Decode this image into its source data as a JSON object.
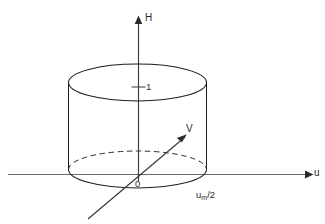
{
  "figure": {
    "background_color": "#ffffff",
    "line_color": "#1d1d1d",
    "axis_color": "#3a3a3a",
    "axes": {
      "vertical": {
        "name": "H-axis",
        "label": "H",
        "arrow": "up"
      },
      "horizontal": {
        "name": "u-axis",
        "label": "u",
        "arrow": "right"
      }
    },
    "origin": {
      "label": "0"
    },
    "ticks": [
      {
        "axis": "H",
        "label": "1"
      }
    ],
    "vector": {
      "name": "V-vector",
      "label": "V",
      "arrow": "up-right"
    },
    "annotations": [
      {
        "name": "u-max-half",
        "base": "u",
        "subscript": "m",
        "suffix": "/2",
        "full_text": "um/2"
      }
    ],
    "shape": {
      "name": "cylinder",
      "top_ellipse": "solid",
      "bottom_ellipse_front": "solid",
      "bottom_ellipse_back": "dashed"
    }
  }
}
